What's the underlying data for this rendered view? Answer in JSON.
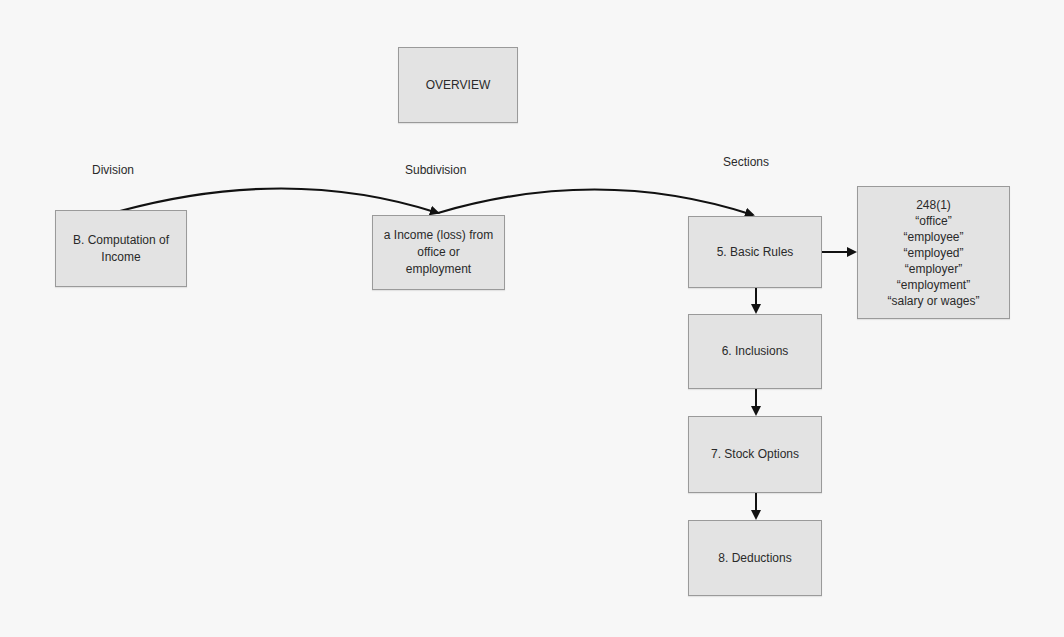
{
  "diagram": {
    "title": "OVERVIEW",
    "column_labels": {
      "division": "Division",
      "subdivision": "Subdivision",
      "sections": "Sections"
    },
    "division_box": {
      "line1": "B. Computation of",
      "line2": "Income"
    },
    "subdivision_box": {
      "line1": "a Income (loss) from",
      "line2": "office or",
      "line3": "employment"
    },
    "sections": [
      {
        "label": "5. Basic Rules"
      },
      {
        "label": "6. Inclusions"
      },
      {
        "label": "7. Stock Options"
      },
      {
        "label": "8. Deductions"
      }
    ],
    "definitions_box": {
      "heading": "248(1)",
      "terms": [
        "“office”",
        "“employee”",
        "“employed”",
        "“employer”",
        "“employment”",
        "“salary or wages”"
      ]
    },
    "colors": {
      "box_fill": "#e3e3e3",
      "box_border": "#9a9a9a",
      "arrow": "#111111",
      "background": "#f7f7f7"
    }
  }
}
